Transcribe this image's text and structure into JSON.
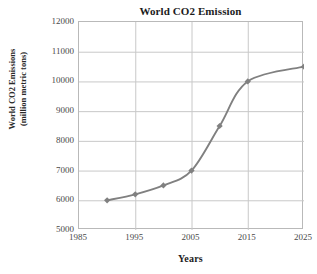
{
  "chart_data": {
    "type": "line",
    "title": "World CO2 Emission",
    "xlabel": "Years",
    "ylabel_line1": "World CO2 Emissions",
    "ylabel_line2": "(million metric tons)",
    "x": [
      1990,
      1995,
      2000,
      2005,
      2010,
      2015,
      2025
    ],
    "values": [
      6000,
      6200,
      6500,
      7000,
      8500,
      10000,
      10500
    ],
    "series": [
      {
        "name": "World CO2 Emissions",
        "values": [
          6000,
          6200,
          6500,
          7000,
          8500,
          10000,
          10500
        ]
      }
    ],
    "xlim": [
      1985,
      2025
    ],
    "ylim": [
      5000,
      12000
    ],
    "x_ticks": [
      1985,
      1995,
      2005,
      2015,
      2025
    ],
    "x_tick_labels": [
      "1985",
      "1995",
      "2005",
      "2015",
      "2025"
    ],
    "y_ticks": [
      5000,
      6000,
      7000,
      8000,
      9000,
      10000,
      11000,
      12000
    ],
    "y_tick_labels": [
      "5000",
      "6000",
      "7000",
      "8000",
      "9000",
      "10000",
      "11000",
      "12000"
    ],
    "grid": true,
    "legend": false,
    "marker": "diamond",
    "line_color": "#808080",
    "marker_color": "#808080",
    "grid_color": "#c8c8c8",
    "plot_border_color": "#b9b9b9",
    "background_color": "#ffffff"
  }
}
